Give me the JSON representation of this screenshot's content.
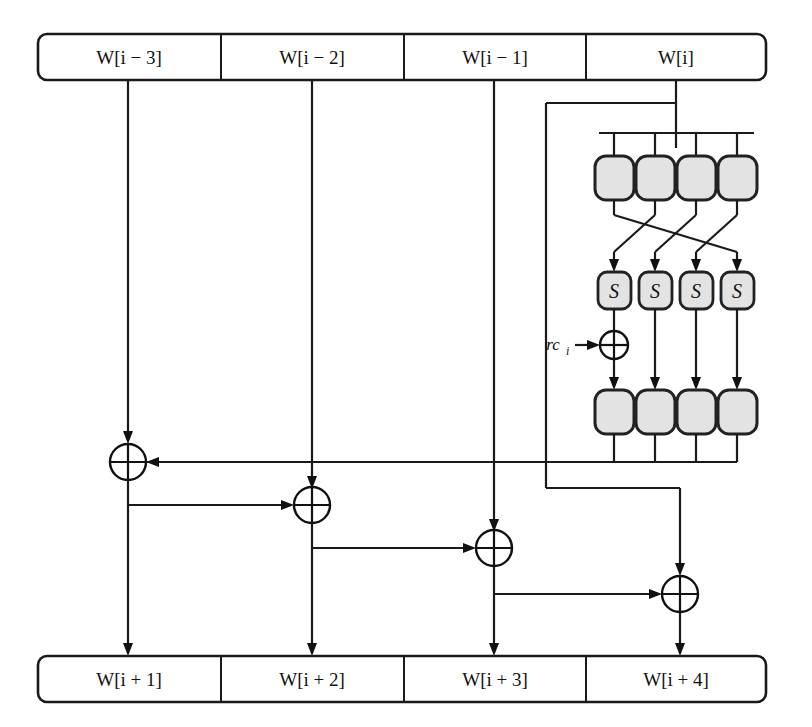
{
  "diagram": {
    "colors": {
      "line": "#1a1a1a",
      "box_fill": "#e3e3e3",
      "box_stroke": "#222222",
      "background": "#ffffff"
    },
    "input_register": {
      "name": "input-word-register",
      "cells": [
        {
          "label": "W[i − 3]"
        },
        {
          "label": "W[i − 2]"
        },
        {
          "label": "W[i − 1]"
        },
        {
          "label": "W[i]"
        }
      ]
    },
    "output_register": {
      "name": "output-word-register",
      "cells": [
        {
          "label": "W[i + 1]"
        },
        {
          "label": "W[i + 2]"
        },
        {
          "label": "W[i + 3]"
        },
        {
          "label": "W[i + 4]"
        }
      ]
    },
    "byte_row_top": {
      "name": "rotword-input-bytes",
      "cells": [
        "",
        "",
        "",
        ""
      ]
    },
    "sbox_row": {
      "name": "subword-sboxes",
      "cells": [
        "S",
        "S",
        "S",
        "S"
      ]
    },
    "byte_row_bottom": {
      "name": "subword-output-bytes",
      "cells": [
        "",
        "",
        "",
        ""
      ]
    },
    "round_constant": {
      "label_main": "rc",
      "label_sub": "i",
      "label_full": "rc_i"
    },
    "xor_gates": [
      {
        "name": "xor-w-i-plus-1"
      },
      {
        "name": "xor-w-i-plus-2"
      },
      {
        "name": "xor-w-i-plus-3"
      },
      {
        "name": "xor-w-i-plus-4"
      },
      {
        "name": "xor-round-constant"
      }
    ]
  }
}
